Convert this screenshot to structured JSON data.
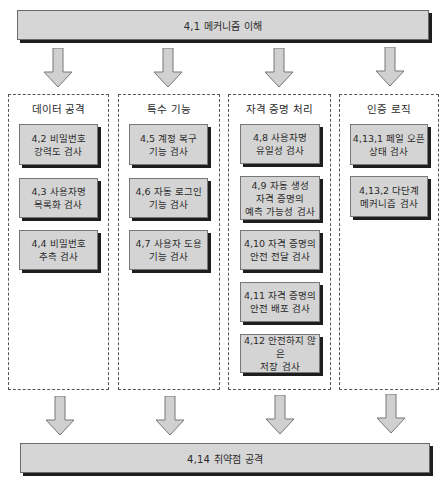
{
  "top_banner": {
    "label": "4,1 메커니즘 이해"
  },
  "bottom_banner": {
    "label": "4,14 취약점 공격"
  },
  "columns": [
    {
      "title": "데이터 공격",
      "items": [
        {
          "label": "4,2 비밀번호\n강력도 검사"
        },
        {
          "label": "4,3 사용자명\n목록화 검사"
        },
        {
          "label": "4,4 비밀번호\n추측 검사"
        }
      ]
    },
    {
      "title": "특수 기능",
      "items": [
        {
          "label": "4,5 계정 복구\n기능 검사"
        },
        {
          "label": "4,6 자동 로그인\n기능 검사"
        },
        {
          "label": "4,7 사용자 도용\n기능 검사"
        }
      ]
    },
    {
      "title": "자격 증명 처리",
      "items": [
        {
          "label": "4,8 사용자명\n유일성 검사"
        },
        {
          "label": "4,9 자동 생성\n자격 증명의\n예측 가능성 검사"
        },
        {
          "label": "4,10 자격 증명의\n안전 전달 검사"
        },
        {
          "label": "4,11 자격 증명의\n안전 배포 검사"
        },
        {
          "label": "4,12 안전하지 않은\n저장 검사"
        }
      ]
    },
    {
      "title": "인증 로직",
      "items": [
        {
          "label": "4,13,1 페일 오픈\n상태 검사"
        },
        {
          "label": "4,13,2 다단계\n메커니즘 검사"
        }
      ]
    }
  ],
  "colors": {
    "box_fill": "#d4d4d4",
    "shadow": "#1e1e1e",
    "arrow_fill": "#d0d0d0",
    "arrow_stroke": "#777777"
  }
}
